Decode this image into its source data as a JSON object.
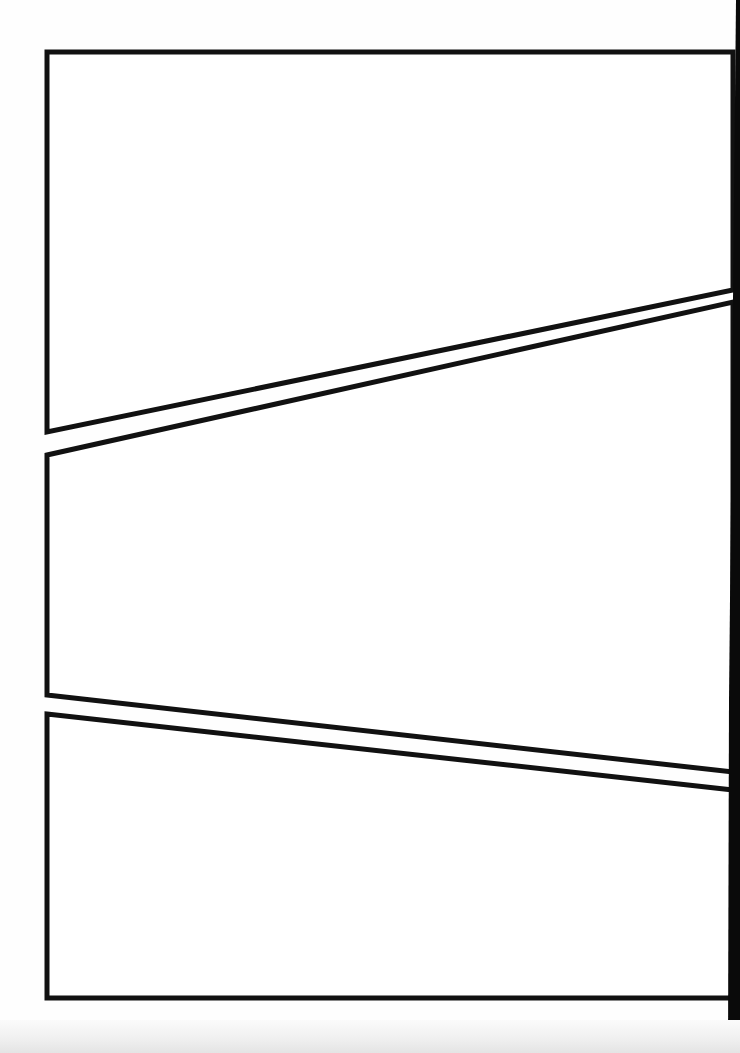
{
  "page": {
    "type": "blank comic panel layout",
    "background_color": "#fefefe",
    "ink_color": "#111111",
    "panel_count": 3
  },
  "panels": [
    {
      "name": "top-panel",
      "points": "47,52 733,52 733,290 47,432"
    },
    {
      "name": "middle-panel",
      "points": "47,455 733,302 733,772 47,695"
    },
    {
      "name": "bottom-panel",
      "points": "47,714 733,790 733,998 47,998"
    }
  ]
}
